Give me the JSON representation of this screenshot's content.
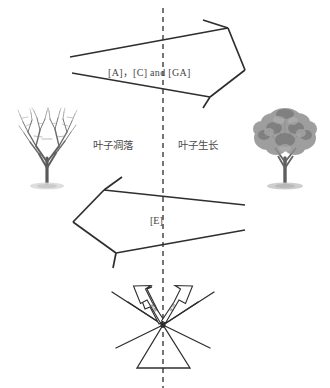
{
  "figure": {
    "background_color": "#ffffff",
    "stroke_color": "#2e2e2e",
    "center_axis": {
      "name": "seasonal-divider",
      "style": "dashed-vertical",
      "x": 163
    }
  },
  "labels": {
    "hormones_top": "[A]，[C] and [GA]",
    "hormone_bottom": "[E]",
    "leaf_fall": "叶子凋落",
    "leaf_growth": "叶子生长",
    "micro_left": "脱落",
    "micro_right": "生长"
  },
  "illustrations": [
    {
      "name": "bare-tree",
      "caption": "叶子凋落",
      "side": "left",
      "state": "leafless"
    },
    {
      "name": "leafy-tree",
      "caption": "叶子生长",
      "side": "right",
      "state": "full-foliage"
    }
  ],
  "arrows": {
    "top": {
      "name": "arrow-to-growth",
      "direction": "right",
      "label": "[A]，[C] and [GA]"
    },
    "bottom": {
      "name": "arrow-to-fall",
      "direction": "left",
      "label": "[E]"
    }
  },
  "burst": {
    "name": "hormone-burst",
    "ray_count": 6,
    "outline_arrows": 2,
    "triangle": true
  }
}
